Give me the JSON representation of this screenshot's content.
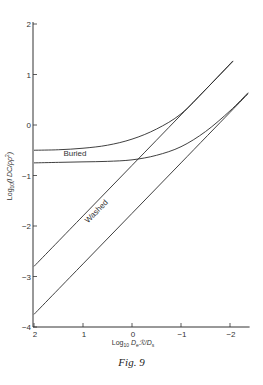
{
  "figure": {
    "caption": "Fig. 9"
  },
  "chart_data": {
    "type": "line",
    "title": "",
    "xlabel": "Log10 D_e ℛ/D_s",
    "ylabel": "Log10 (l DC/ρρ²)",
    "xlim": [
      2,
      -2.4
    ],
    "ylim": [
      -4,
      2
    ],
    "x_ticks": [
      2,
      1,
      0,
      -1,
      -2
    ],
    "y_ticks": [
      2,
      1,
      0,
      -1,
      -2,
      -3,
      -4
    ],
    "x_reversed": true,
    "grid": false,
    "legend": "none (inline labels)",
    "annotations": [
      {
        "text": "Buried",
        "x": 1.4,
        "y": -0.62
      },
      {
        "text": "Washed",
        "x": 0.9,
        "y": -1.95,
        "rotation": -45
      }
    ],
    "series": [
      {
        "name": "Washed (upper straight line)",
        "x": [
          2,
          1,
          0,
          -1,
          -2.06
        ],
        "y": [
          -2.8,
          -1.8,
          -0.8,
          0.2,
          1.26
        ]
      },
      {
        "name": "Washed (lower straight line)",
        "x": [
          2,
          1,
          0,
          -1,
          -2,
          -2.37
        ],
        "y": [
          -3.75,
          -2.75,
          -1.75,
          -0.75,
          0.25,
          0.62
        ]
      },
      {
        "name": "Buried (upper curve)",
        "x": [
          2,
          1.5,
          1,
          0.5,
          0,
          -0.5,
          -1,
          -1.5,
          -2.06
        ],
        "y": [
          -0.5,
          -0.49,
          -0.46,
          -0.4,
          -0.28,
          -0.08,
          0.22,
          0.7,
          1.27
        ]
      },
      {
        "name": "Buried (lower curve)",
        "x": [
          2,
          1.5,
          1,
          0.5,
          0,
          -0.5,
          -1,
          -1.5,
          -2,
          -2.37
        ],
        "y": [
          -0.75,
          -0.74,
          -0.73,
          -0.72,
          -0.69,
          -0.6,
          -0.43,
          -0.13,
          0.28,
          0.64
        ]
      }
    ]
  }
}
